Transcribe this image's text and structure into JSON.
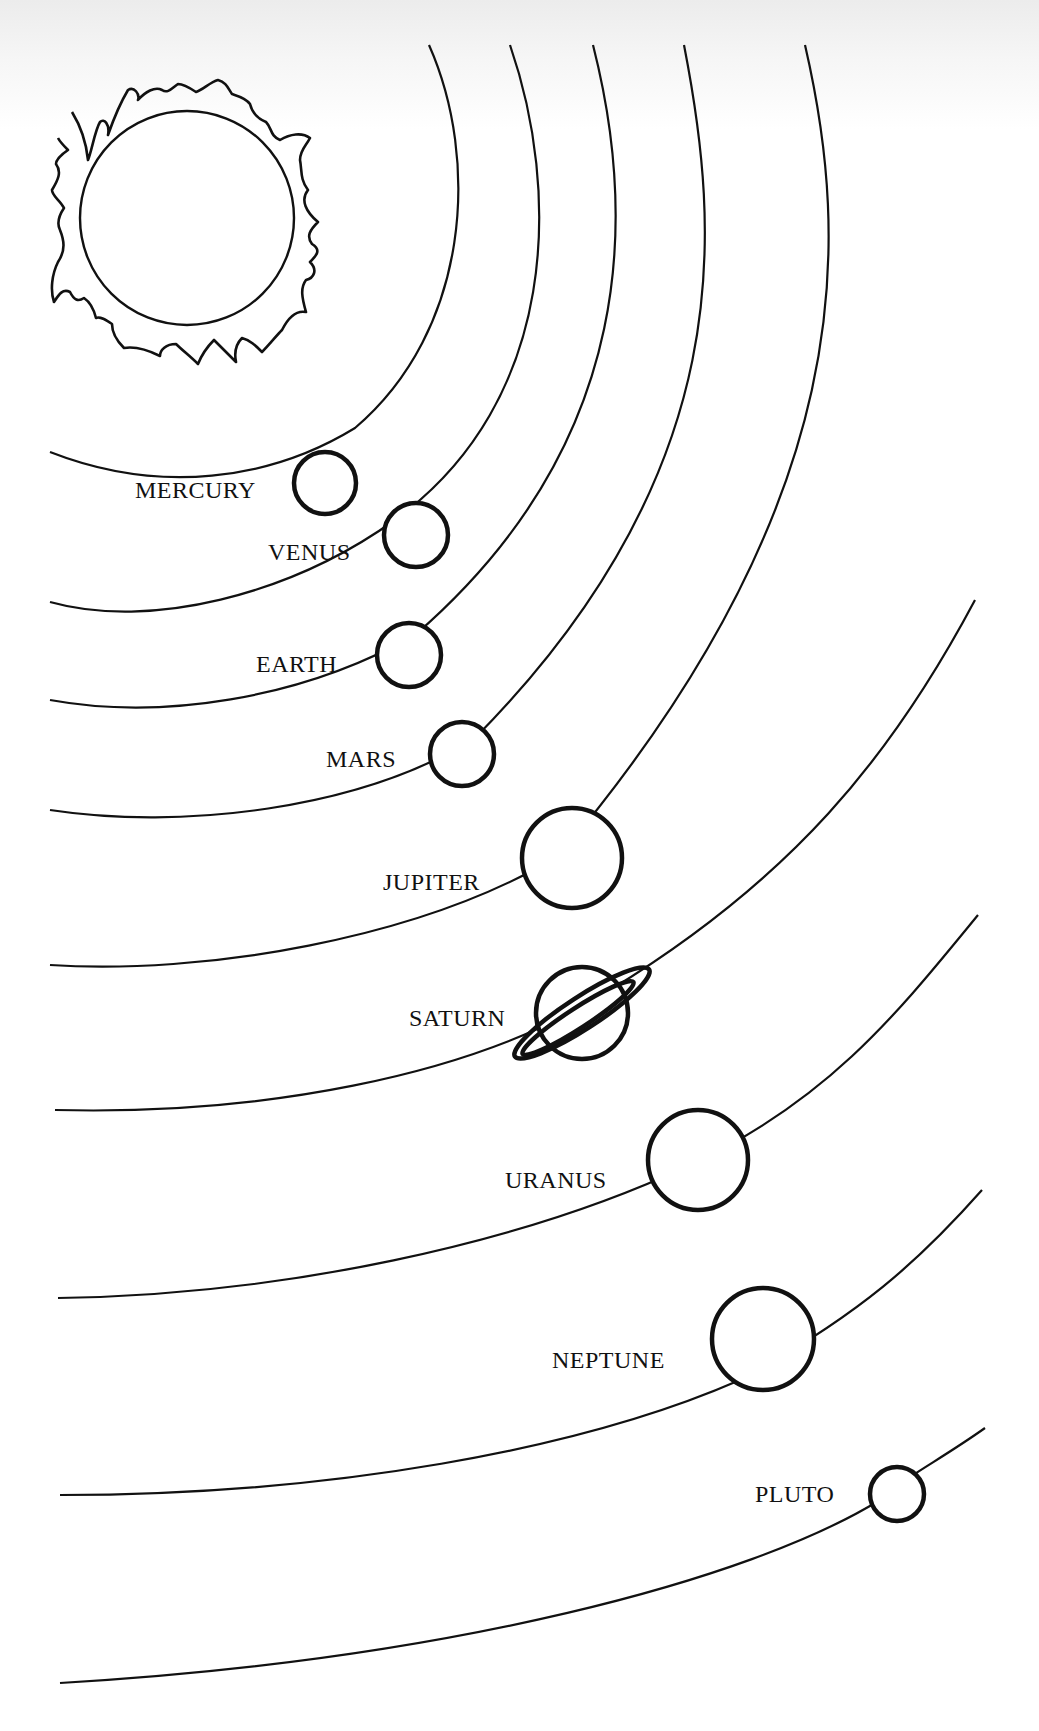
{
  "diagram": {
    "title": "",
    "type": "solar-system",
    "sun": {
      "name": "Sun",
      "label": ""
    },
    "planets": [
      {
        "name": "MERCURY",
        "order": 1
      },
      {
        "name": "VENUS",
        "order": 2
      },
      {
        "name": "EARTH",
        "order": 3
      },
      {
        "name": "MARS",
        "order": 4
      },
      {
        "name": "JUPITER",
        "order": 5
      },
      {
        "name": "SATURN",
        "order": 6
      },
      {
        "name": "URANUS",
        "order": 7
      },
      {
        "name": "NEPTUNE",
        "order": 8
      },
      {
        "name": "PLUTO",
        "order": 9
      }
    ],
    "colors": {
      "stroke": "#111111",
      "background": "#ffffff"
    }
  }
}
